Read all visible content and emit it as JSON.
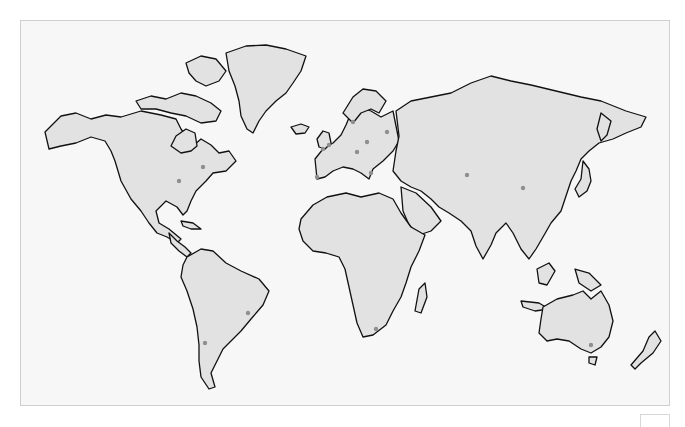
{
  "map": {
    "title": "",
    "land_color": "#e2e2e2",
    "ocean_color": "#f7f7f7",
    "coast_color": "#111111",
    "marker_color": "#8f8f8f",
    "markers": [
      {
        "region": "north-america-central",
        "x": 178,
        "y": 180
      },
      {
        "region": "north-america-east-coast",
        "x": 202,
        "y": 166
      },
      {
        "region": "uk",
        "x": 328,
        "y": 144
      },
      {
        "region": "france-paris",
        "x": 322,
        "y": 148
      },
      {
        "region": "iberia",
        "x": 316,
        "y": 176
      },
      {
        "region": "germany",
        "x": 366,
        "y": 141
      },
      {
        "region": "central-europe",
        "x": 356,
        "y": 151
      },
      {
        "region": "russia-moscow",
        "x": 386,
        "y": 131
      },
      {
        "region": "scandinavia",
        "x": 352,
        "y": 121
      },
      {
        "region": "mediterranean-east",
        "x": 370,
        "y": 172
      },
      {
        "region": "central-asia",
        "x": 466,
        "y": 174
      },
      {
        "region": "china",
        "x": 522,
        "y": 187
      },
      {
        "region": "brazil",
        "x": 247,
        "y": 312
      },
      {
        "region": "argentina-chile",
        "x": 204,
        "y": 342
      },
      {
        "region": "south-africa",
        "x": 375,
        "y": 328
      },
      {
        "region": "australia-southeast",
        "x": 590,
        "y": 344
      }
    ]
  },
  "corner_box": {
    "label": ""
  }
}
